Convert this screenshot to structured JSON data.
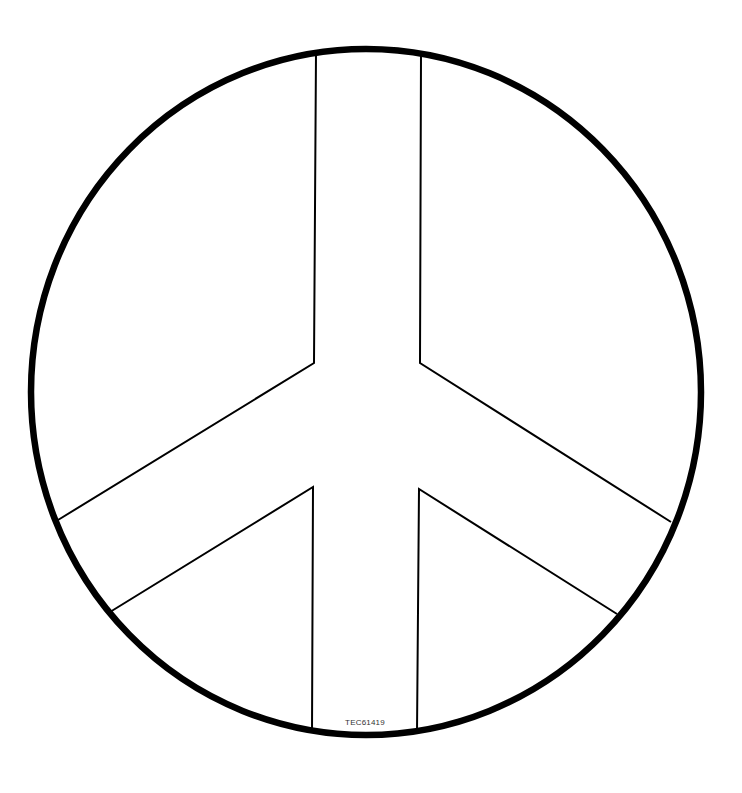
{
  "figure": {
    "stroke_color": "#000000",
    "background": "#ffffff",
    "product_code": "TEC61419"
  }
}
